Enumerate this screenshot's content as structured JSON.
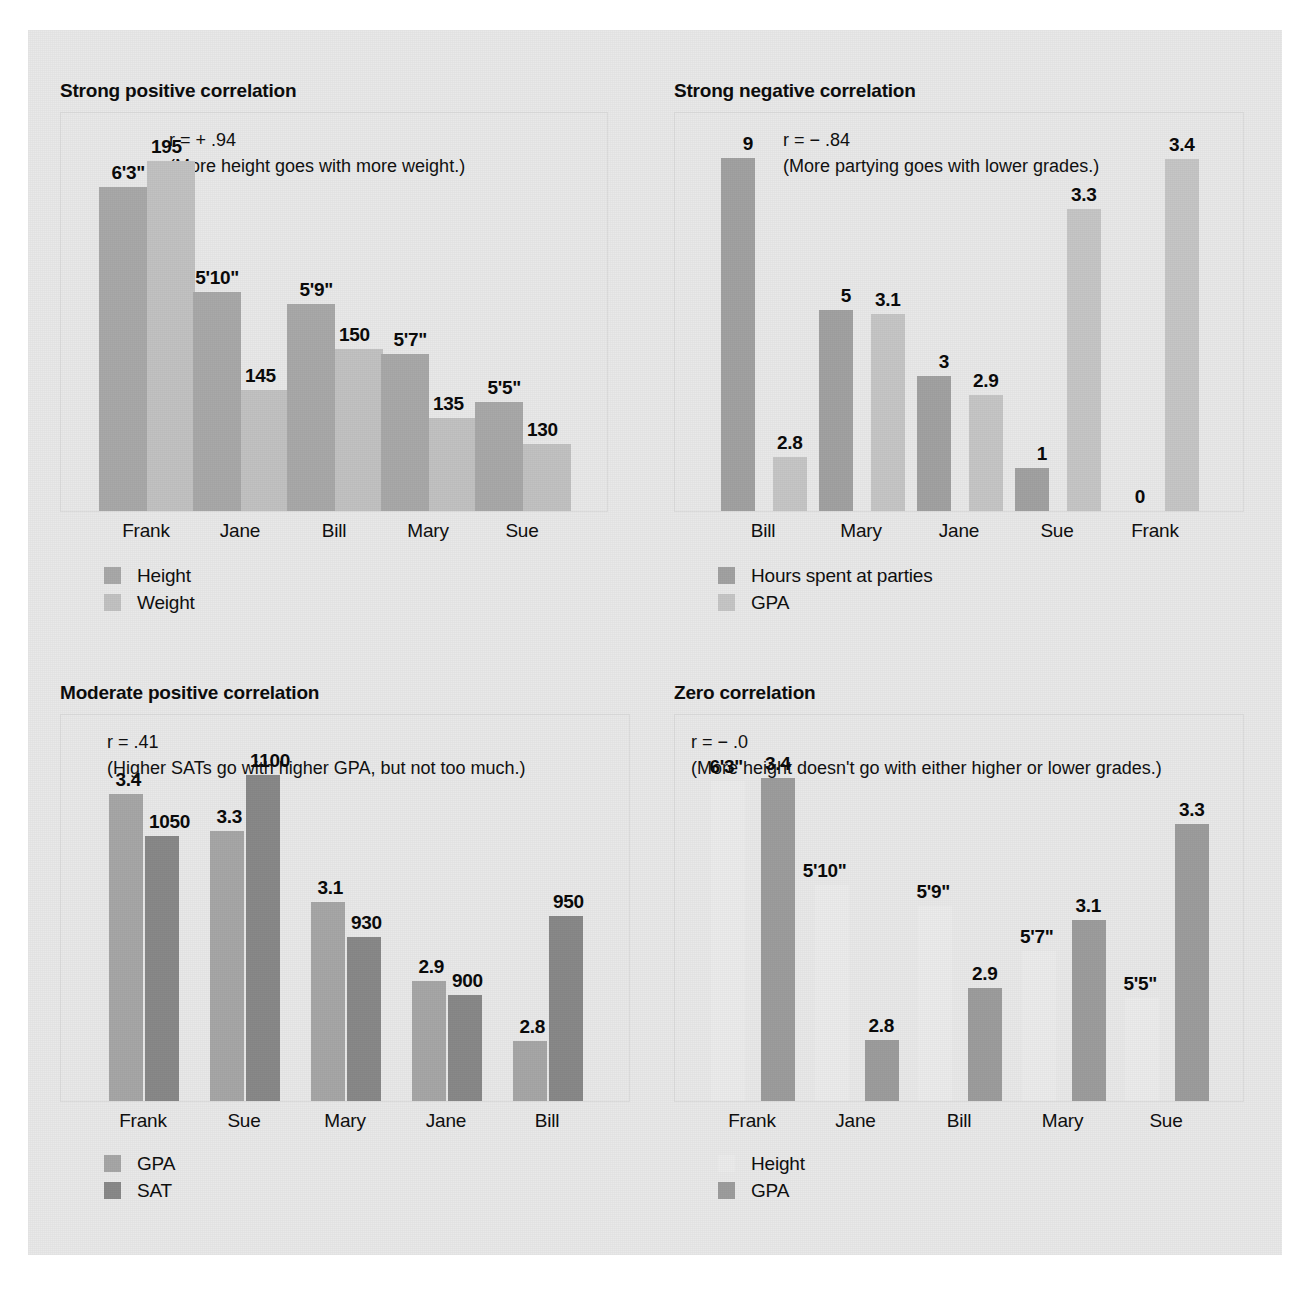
{
  "colors": {
    "page_background": "#e9e9e9",
    "outer_background": "#ffffff",
    "plot_border": "#dcdcdc",
    "text": "#101010",
    "bar_medium_gray": "#a9a9a9",
    "bar_light_gray": "#c2c2c2",
    "bar_dark_gray": "#8a8a8a",
    "bar_white": "#f0f0f0"
  },
  "charts": [
    {
      "id": "strong-positive",
      "title": "Strong positive correlation",
      "r_text": "r = + .94",
      "caption": "(More height goes with more weight.)",
      "categories": [
        "Frank",
        "Jane",
        "Bill",
        "Mary",
        "Sue"
      ],
      "series": [
        {
          "name": "Height",
          "color": "#a9a9a9",
          "labels": [
            "6'3\"",
            "5'10\"",
            "5'9\"",
            "5'7\"",
            "5'5\""
          ],
          "heights": [
            0.885,
            0.598,
            0.565,
            0.428,
            0.298
          ]
        },
        {
          "name": "Weight",
          "color": "#c2c2c2",
          "labels": [
            "195",
            "145",
            "150",
            "135",
            "130"
          ],
          "heights": [
            0.955,
            0.332,
            0.444,
            0.255,
            0.182
          ]
        }
      ],
      "legend": [
        {
          "label": "Height",
          "color": "#a9a9a9"
        },
        {
          "label": "Weight",
          "color": "#c2c2c2"
        }
      ]
    },
    {
      "id": "strong-negative",
      "title": "Strong negative correlation",
      "r_text": "r = − .84",
      "caption": "(More partying goes with lower grades.)",
      "categories": [
        "Bill",
        "Mary",
        "Jane",
        "Sue",
        "Frank"
      ],
      "series": [
        {
          "name": "Hours spent at parties",
          "color": "#a2a2a2",
          "labels": [
            "9",
            "5",
            "3",
            "1",
            "0"
          ],
          "heights": [
            0.965,
            0.548,
            0.368,
            0.118,
            0.0
          ]
        },
        {
          "name": "GPA",
          "color": "#c6c6c6",
          "labels": [
            "2.8",
            "3.1",
            "2.9",
            "3.3",
            "3.4"
          ],
          "heights": [
            0.148,
            0.538,
            0.318,
            0.825,
            0.962
          ]
        }
      ],
      "legend": [
        {
          "label": "Hours spent at parties",
          "color": "#a2a2a2"
        },
        {
          "label": "GPA",
          "color": "#c6c6c6"
        }
      ]
    },
    {
      "id": "moderate-positive",
      "title": "Moderate positive correlation",
      "r_text": "r =  .41",
      "caption": "(Higher SATs go with higher GPA, but not too much.)",
      "categories": [
        "Frank",
        "Sue",
        "Mary",
        "Jane",
        "Bill"
      ],
      "series": [
        {
          "name": "GPA",
          "color": "#a7a7a7",
          "labels": [
            "3.4",
            "3.3",
            "3.1",
            "2.9",
            "2.8"
          ],
          "heights": [
            0.868,
            0.762,
            0.562,
            0.338,
            0.17
          ]
        },
        {
          "name": "SAT",
          "color": "#898989",
          "labels": [
            "1050",
            "1100",
            "930",
            "900",
            "950"
          ],
          "heights": [
            0.748,
            0.922,
            0.462,
            0.3,
            0.522
          ]
        }
      ],
      "legend": [
        {
          "label": "GPA",
          "color": "#a7a7a7"
        },
        {
          "label": "SAT",
          "color": "#898989"
        }
      ]
    },
    {
      "id": "zero-correlation",
      "title": "Zero correlation",
      "r_text": "r = − .0",
      "caption": "(More height doesn't go with either higher or lower grades.)",
      "categories": [
        "Frank",
        "Jane",
        "Bill",
        "Mary",
        "Sue"
      ],
      "series": [
        {
          "name": "Height",
          "color": "#ececec",
          "labels": [
            "6'3\"",
            "5'10\"",
            "5'9\"",
            "5'7\"",
            "5'5\""
          ],
          "heights": [
            0.905,
            0.61,
            0.552,
            0.425,
            0.292
          ]
        },
        {
          "name": "GPA",
          "color": "#9d9d9d",
          "labels": [
            "3.4",
            "2.8",
            "2.9",
            "3.1",
            "3.3"
          ],
          "heights": [
            0.912,
            0.172,
            0.318,
            0.512,
            0.782
          ]
        }
      ],
      "legend": [
        {
          "label": "Height",
          "color": "#ececec"
        },
        {
          "label": "GPA",
          "color": "#9d9d9d"
        }
      ]
    }
  ],
  "chart_data": {
    "type": "bar",
    "charts": [
      {
        "type": "bar",
        "title": "Strong positive correlation",
        "annotation_r": "r = + .94",
        "annotation_caption": "(More height goes with more weight.)",
        "categories": [
          "Frank",
          "Jane",
          "Bill",
          "Mary",
          "Sue"
        ],
        "series": [
          {
            "name": "Height",
            "values": [
              "6'3\"",
              "5'10\"",
              "5'9\"",
              "5'7\"",
              "5'5\""
            ],
            "unit": "feet-inches"
          },
          {
            "name": "Weight",
            "values": [
              195,
              145,
              150,
              135,
              130
            ],
            "unit": "pounds"
          }
        ],
        "legend_position": "below-left",
        "grid": false,
        "xlabel": "",
        "ylabel": ""
      },
      {
        "type": "bar",
        "title": "Strong negative correlation",
        "annotation_r": "r = − .84",
        "annotation_caption": "(More partying goes with lower grades.)",
        "categories": [
          "Bill",
          "Mary",
          "Jane",
          "Sue",
          "Frank"
        ],
        "series": [
          {
            "name": "Hours spent at parties",
            "values": [
              9,
              5,
              3,
              1,
              0
            ],
            "unit": "hours"
          },
          {
            "name": "GPA",
            "values": [
              2.8,
              3.1,
              2.9,
              3.3,
              3.4
            ],
            "unit": "gpa"
          }
        ],
        "legend_position": "below-left",
        "grid": false,
        "xlabel": "",
        "ylabel": ""
      },
      {
        "type": "bar",
        "title": "Moderate positive correlation",
        "annotation_r": "r =  .41",
        "annotation_caption": "(Higher SATs go with higher GPA, but not too much.)",
        "categories": [
          "Frank",
          "Sue",
          "Mary",
          "Jane",
          "Bill"
        ],
        "series": [
          {
            "name": "GPA",
            "values": [
              3.4,
              3.3,
              3.1,
              2.9,
              2.8
            ],
            "unit": "gpa"
          },
          {
            "name": "SAT",
            "values": [
              1050,
              1100,
              930,
              900,
              950
            ],
            "unit": "score"
          }
        ],
        "legend_position": "below-left",
        "grid": false,
        "xlabel": "",
        "ylabel": ""
      },
      {
        "type": "bar",
        "title": "Zero correlation",
        "annotation_r": "r = − .0",
        "annotation_caption": "(More height doesn't go with either higher or lower grades.)",
        "categories": [
          "Frank",
          "Jane",
          "Bill",
          "Mary",
          "Sue"
        ],
        "series": [
          {
            "name": "Height",
            "values": [
              "6'3\"",
              "5'10\"",
              "5'9\"",
              "5'7\"",
              "5'5\""
            ],
            "unit": "feet-inches"
          },
          {
            "name": "GPA",
            "values": [
              3.4,
              2.8,
              2.9,
              3.1,
              3.3
            ],
            "unit": "gpa"
          }
        ],
        "legend_position": "below-left",
        "grid": false,
        "xlabel": "",
        "ylabel": ""
      }
    ]
  }
}
